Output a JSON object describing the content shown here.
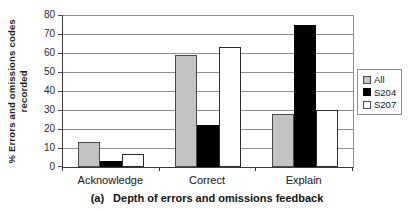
{
  "figure": {
    "ylabel_line1": "% Errors and omissions codes",
    "ylabel_line2": "recorded",
    "caption_prefix": "(a)",
    "caption_text": "Depth of errors and omissions feedback"
  },
  "chart_data": {
    "type": "bar",
    "title": "",
    "categories": [
      "Acknowledge",
      "Correct",
      "Explain"
    ],
    "series": [
      {
        "name": "All",
        "values": [
          13,
          59,
          28
        ],
        "fill": "#c3c3c3",
        "stroke": "#4a4a4a"
      },
      {
        "name": "S204",
        "values": [
          3,
          22,
          75
        ],
        "fill": "#000000",
        "stroke": "#000000"
      },
      {
        "name": "S207",
        "values": [
          7,
          63,
          30
        ],
        "fill": "#ffffff",
        "stroke": "#2b2b2b"
      }
    ],
    "xlabel": "(a) Depth of errors and omissions feedback",
    "ylabel": "% Errors and omissions codes recorded",
    "ylim": [
      0,
      80
    ],
    "yticks": [
      0,
      10,
      20,
      30,
      40,
      50,
      60,
      70,
      80
    ],
    "grid": true,
    "legend": {
      "position": "right",
      "entries": [
        "All",
        "S204",
        "S207"
      ]
    }
  },
  "style": {
    "grid_color": "#8f8f8f",
    "axis_color": "#3c3c3c",
    "text_color": "#1f1f1f"
  }
}
